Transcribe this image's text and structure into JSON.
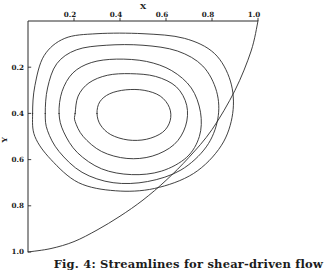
{
  "figure": {
    "caption": "Fig. 4: Streamlines for shear-driven flow",
    "axis_label_x": "X",
    "axis_label_y": "Y",
    "line_color": "#2b2b2b",
    "background_color": "#ffffff"
  },
  "chart_data": {
    "type": "line",
    "title": "Fig. 4: Streamlines for shear-driven flow",
    "xlabel": "X",
    "ylabel": "Y",
    "xlim": [
      0.0,
      1.0
    ],
    "ylim": [
      0.0,
      1.0
    ],
    "y_axis_inverted": true,
    "x_axis_position": "top",
    "y_axis_position": "left",
    "grid": false,
    "legend": null,
    "xticks": [
      0.2,
      0.4,
      0.6,
      0.8,
      1.0
    ],
    "xtick_labels": [
      "0.2",
      "0.4",
      "0.6",
      "0.8",
      "1.0"
    ],
    "yticks": [
      0.2,
      0.4,
      0.6,
      0.8,
      1.0
    ],
    "ytick_labels": [
      "0.2",
      "0.4",
      "0.6",
      "0.8",
      "1.0"
    ],
    "series": [
      {
        "name": "domain-boundary-curve",
        "kind": "boundary",
        "points": [
          [
            0.0,
            1.0
          ],
          [
            0.1,
            0.985
          ],
          [
            0.2,
            0.955
          ],
          [
            0.3,
            0.905
          ],
          [
            0.4,
            0.845
          ],
          [
            0.5,
            0.775
          ],
          [
            0.6,
            0.69
          ],
          [
            0.7,
            0.59
          ],
          [
            0.8,
            0.47
          ],
          [
            0.9,
            0.3
          ],
          [
            0.97,
            0.13
          ],
          [
            1.0,
            0.0
          ]
        ]
      },
      {
        "name": "streamline-1-outer",
        "kind": "contour",
        "level": 1,
        "points": [
          [
            0.02,
            0.4
          ],
          [
            0.03,
            0.28
          ],
          [
            0.07,
            0.15
          ],
          [
            0.16,
            0.075
          ],
          [
            0.3,
            0.055
          ],
          [
            0.5,
            0.055
          ],
          [
            0.68,
            0.075
          ],
          [
            0.81,
            0.14
          ],
          [
            0.88,
            0.26
          ],
          [
            0.89,
            0.4
          ],
          [
            0.84,
            0.54
          ],
          [
            0.72,
            0.66
          ],
          [
            0.55,
            0.725
          ],
          [
            0.38,
            0.735
          ],
          [
            0.22,
            0.7
          ],
          [
            0.1,
            0.6
          ],
          [
            0.03,
            0.5
          ],
          [
            0.02,
            0.4
          ]
        ]
      },
      {
        "name": "streamline-2",
        "kind": "contour",
        "level": 2,
        "points": [
          [
            0.075,
            0.4
          ],
          [
            0.085,
            0.29
          ],
          [
            0.125,
            0.185
          ],
          [
            0.21,
            0.125
          ],
          [
            0.34,
            0.105
          ],
          [
            0.5,
            0.105
          ],
          [
            0.65,
            0.13
          ],
          [
            0.76,
            0.195
          ],
          [
            0.82,
            0.305
          ],
          [
            0.825,
            0.425
          ],
          [
            0.775,
            0.545
          ],
          [
            0.665,
            0.645
          ],
          [
            0.52,
            0.695
          ],
          [
            0.37,
            0.7
          ],
          [
            0.235,
            0.655
          ],
          [
            0.135,
            0.565
          ],
          [
            0.085,
            0.475
          ],
          [
            0.075,
            0.4
          ]
        ]
      },
      {
        "name": "streamline-3",
        "kind": "contour",
        "level": 3,
        "points": [
          [
            0.135,
            0.4
          ],
          [
            0.148,
            0.305
          ],
          [
            0.195,
            0.225
          ],
          [
            0.275,
            0.18
          ],
          [
            0.385,
            0.165
          ],
          [
            0.515,
            0.175
          ],
          [
            0.625,
            0.215
          ],
          [
            0.71,
            0.29
          ],
          [
            0.75,
            0.395
          ],
          [
            0.745,
            0.5
          ],
          [
            0.69,
            0.59
          ],
          [
            0.58,
            0.65
          ],
          [
            0.45,
            0.665
          ],
          [
            0.32,
            0.64
          ],
          [
            0.215,
            0.57
          ],
          [
            0.155,
            0.48
          ],
          [
            0.135,
            0.4
          ]
        ]
      },
      {
        "name": "streamline-4",
        "kind": "contour",
        "level": 4,
        "points": [
          [
            0.205,
            0.4
          ],
          [
            0.218,
            0.325
          ],
          [
            0.265,
            0.268
          ],
          [
            0.345,
            0.235
          ],
          [
            0.445,
            0.228
          ],
          [
            0.555,
            0.24
          ],
          [
            0.645,
            0.285
          ],
          [
            0.69,
            0.365
          ],
          [
            0.685,
            0.455
          ],
          [
            0.635,
            0.535
          ],
          [
            0.54,
            0.585
          ],
          [
            0.43,
            0.595
          ],
          [
            0.32,
            0.565
          ],
          [
            0.24,
            0.5
          ],
          [
            0.205,
            0.435
          ],
          [
            0.205,
            0.4
          ]
        ]
      },
      {
        "name": "streamline-5-inner",
        "kind": "contour",
        "level": 5,
        "points": [
          [
            0.3,
            0.4
          ],
          [
            0.312,
            0.35
          ],
          [
            0.355,
            0.315
          ],
          [
            0.425,
            0.298
          ],
          [
            0.505,
            0.3
          ],
          [
            0.575,
            0.325
          ],
          [
            0.615,
            0.375
          ],
          [
            0.618,
            0.432
          ],
          [
            0.585,
            0.482
          ],
          [
            0.515,
            0.512
          ],
          [
            0.435,
            0.515
          ],
          [
            0.36,
            0.492
          ],
          [
            0.315,
            0.45
          ],
          [
            0.3,
            0.4
          ]
        ]
      }
    ]
  }
}
